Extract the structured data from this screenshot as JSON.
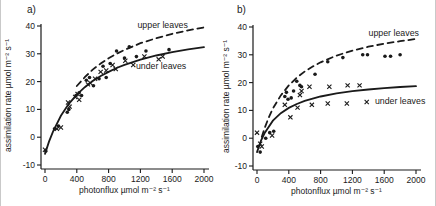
{
  "figure": {
    "background": "#ffffff",
    "ink": "#1a1a1a"
  },
  "chart_data": [
    {
      "type": "scatter",
      "panel_label": "a)",
      "xlabel": "photonflux µmol  m⁻² s⁻¹",
      "ylabel": "assimilation rate µmol  m⁻² s⁻¹",
      "xlim": [
        0,
        2000
      ],
      "ylim": [
        -10,
        40
      ],
      "x_ticks": [
        0,
        400,
        800,
        1200,
        1600,
        2000
      ],
      "y_ticks": [
        40,
        30,
        20,
        10,
        0,
        -10
      ],
      "grid": false,
      "legend_position": "inline-annotations",
      "series": [
        {
          "name": "upper leaves",
          "label": "upper leaves",
          "marker": "dot",
          "line_style": "dashed",
          "label_pos": [
            1480,
            40.5
          ],
          "points": [
            [
              10,
              -5
            ],
            [
              120,
              3
            ],
            [
              170,
              4
            ],
            [
              280,
              9
            ],
            [
              300,
              10
            ],
            [
              390,
              15
            ],
            [
              430,
              16
            ],
            [
              460,
              15
            ],
            [
              520,
              20.5
            ],
            [
              560,
              21.5
            ],
            [
              610,
              18.5
            ],
            [
              680,
              21
            ],
            [
              730,
              25.5
            ],
            [
              770,
              21.5
            ],
            [
              820,
              26.5
            ],
            [
              900,
              31
            ],
            [
              1000,
              28.5
            ],
            [
              1060,
              32.5
            ],
            [
              1150,
              29
            ],
            [
              1270,
              31
            ],
            [
              1560,
              31.5
            ]
          ],
          "trend": [
            [
              400,
              18.4
            ],
            [
              500,
              21.6
            ],
            [
              600,
              24.3
            ],
            [
              700,
              26.5
            ],
            [
              800,
              28.4
            ],
            [
              900,
              30.0
            ],
            [
              1000,
              31.4
            ],
            [
              1200,
              33.8
            ],
            [
              1400,
              35.6
            ],
            [
              1600,
              37.2
            ],
            [
              1800,
              38.4
            ],
            [
              2000,
              39.5
            ]
          ]
        },
        {
          "name": "under leaves",
          "label": "under leaves",
          "marker": "x",
          "line_style": "solid",
          "label_pos": [
            1460,
            25.5
          ],
          "points": [
            [
              0,
              -4.5
            ],
            [
              150,
              3
            ],
            [
              200,
              3.5
            ],
            [
              290,
              12.5
            ],
            [
              310,
              11
            ],
            [
              380,
              14.5
            ],
            [
              410,
              15.5
            ],
            [
              430,
              13.5
            ],
            [
              540,
              19
            ],
            [
              570,
              19.5
            ],
            [
              630,
              21
            ],
            [
              700,
              23.5
            ],
            [
              770,
              24
            ],
            [
              850,
              26
            ],
            [
              890,
              24.5
            ],
            [
              1010,
              27.5
            ],
            [
              1110,
              26
            ],
            [
              1250,
              29
            ],
            [
              1430,
              28
            ],
            [
              1480,
              29
            ]
          ],
          "trend": [
            [
              0,
              -6
            ],
            [
              50,
              -1.6
            ],
            [
              100,
              2
            ],
            [
              200,
              7.7
            ],
            [
              300,
              12
            ],
            [
              400,
              15.3
            ],
            [
              500,
              18
            ],
            [
              600,
              20.2
            ],
            [
              700,
              22
            ],
            [
              800,
              23.5
            ],
            [
              900,
              24.9
            ],
            [
              1000,
              26
            ],
            [
              1200,
              27.9
            ],
            [
              1400,
              29.4
            ],
            [
              1600,
              30.6
            ],
            [
              1800,
              31.6
            ],
            [
              2000,
              32.4
            ]
          ]
        }
      ]
    },
    {
      "type": "scatter",
      "panel_label": "b)",
      "xlabel": "photonflux µmol  m⁻² s⁻¹",
      "ylabel": "assimilation rate µmol  m⁻² s⁻¹",
      "xlim": [
        0,
        2000
      ],
      "ylim": [
        -10,
        40
      ],
      "x_ticks": [
        0,
        400,
        800,
        1200,
        1600,
        2000
      ],
      "y_ticks": [
        40,
        30,
        20,
        10,
        0,
        -10
      ],
      "grid": false,
      "legend_position": "inline-annotations",
      "series": [
        {
          "name": "upper leaves",
          "label": "upper leaves",
          "marker": "dot",
          "line_style": "dashed",
          "label_pos": [
            1720,
            38
          ],
          "points": [
            [
              10,
              -3
            ],
            [
              40,
              -5
            ],
            [
              110,
              0
            ],
            [
              160,
              2
            ],
            [
              210,
              2.5
            ],
            [
              350,
              15
            ],
            [
              370,
              16.5
            ],
            [
              390,
              14
            ],
            [
              430,
              14.5
            ],
            [
              460,
              17
            ],
            [
              500,
              20.5
            ],
            [
              540,
              19
            ],
            [
              560,
              18.5
            ],
            [
              730,
              23
            ],
            [
              890,
              27.5
            ],
            [
              1080,
              29
            ],
            [
              1330,
              30
            ],
            [
              1390,
              30
            ],
            [
              1610,
              29.5
            ],
            [
              1680,
              29.5
            ],
            [
              1800,
              30
            ]
          ],
          "trend": [
            [
              60,
              0.5
            ],
            [
              100,
              4
            ],
            [
              150,
              7.6
            ],
            [
              200,
              10.7
            ],
            [
              300,
              15.4
            ],
            [
              400,
              19
            ],
            [
              500,
              21.8
            ],
            [
              600,
              24
            ],
            [
              700,
              25.8
            ],
            [
              800,
              27.3
            ],
            [
              1000,
              29.7
            ],
            [
              1200,
              31.5
            ],
            [
              1400,
              32.9
            ],
            [
              1600,
              34
            ],
            [
              1800,
              34.9
            ],
            [
              2000,
              35.7
            ]
          ]
        },
        {
          "name": "under leaves",
          "label": "under leaves",
          "marker": "x",
          "line_style": "solid",
          "label_pos": [
            1800,
            13.5
          ],
          "points": [
            [
              0,
              2
            ],
            [
              40,
              -2
            ],
            [
              60,
              -3
            ],
            [
              190,
              1
            ],
            [
              350,
              12
            ],
            [
              420,
              7.5
            ],
            [
              510,
              11
            ],
            [
              540,
              15.5
            ],
            [
              560,
              17
            ],
            [
              660,
              18.5
            ],
            [
              690,
              12
            ],
            [
              890,
              12.5
            ],
            [
              910,
              18.5
            ],
            [
              1130,
              12.5
            ],
            [
              1140,
              19
            ],
            [
              1290,
              19
            ],
            [
              1380,
              13
            ]
          ],
          "trend": [
            [
              0,
              -5
            ],
            [
              50,
              -0.9
            ],
            [
              100,
              2.1
            ],
            [
              200,
              6.3
            ],
            [
              300,
              9
            ],
            [
              400,
              10.9
            ],
            [
              500,
              12.3
            ],
            [
              600,
              13.4
            ],
            [
              800,
              15
            ],
            [
              1000,
              16.1
            ],
            [
              1200,
              16.9
            ],
            [
              1400,
              17.5
            ],
            [
              1600,
              18
            ],
            [
              1800,
              18.4
            ],
            [
              2000,
              18.7
            ]
          ]
        }
      ]
    }
  ]
}
